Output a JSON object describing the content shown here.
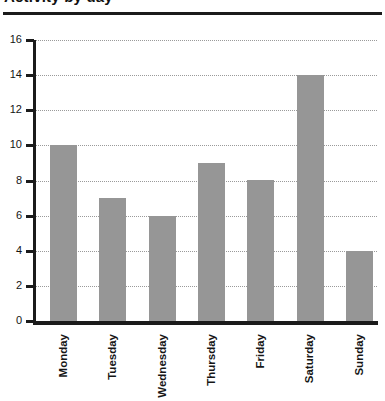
{
  "figure": {
    "title_partial": "Activity by day",
    "title_note": "top of title is cropped out of frame",
    "background_color": "#ffffff",
    "bar_color": "#969696",
    "axis_color": "#1b1b1b",
    "grid_color": "#9a9a9a"
  },
  "chart_data": {
    "type": "bar",
    "title": "Activity by day",
    "xlabel": "",
    "ylabel": "",
    "categories": [
      "Monday",
      "Tuesday",
      "Wednesday",
      "Thursday",
      "Friday",
      "Saturday",
      "Sunday"
    ],
    "values": [
      10,
      7,
      6,
      9,
      8,
      14,
      4
    ],
    "ylim": [
      0,
      16
    ],
    "ytick_labels": [
      "0",
      "2",
      "4",
      "6",
      "8",
      "10",
      "12",
      "14",
      "16"
    ],
    "ytick_values": [
      0,
      2,
      4,
      6,
      8,
      10,
      12,
      14,
      16
    ],
    "grid": "horizontal-dotted",
    "legend": "none",
    "xtick_label_rotation": 90
  }
}
